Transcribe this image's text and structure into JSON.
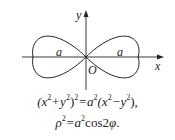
{
  "figure": {
    "type": "lemniscate of Bernoulli",
    "axis_labels": {
      "x": "x",
      "y": "y",
      "origin": "O"
    },
    "lobe_labels": [
      "a",
      "a"
    ],
    "colors": {
      "curve": "#222222",
      "axes": "#222222"
    }
  },
  "equations": {
    "cartesian": {
      "lhs_open": "(x",
      "exp1": "2",
      "plus": "+y",
      "exp2": "2",
      "close": ")",
      "exp3": "2",
      "eq": "=a",
      "exp4": "2",
      "paren": "(x",
      "exp5": "2",
      "minus": "−y",
      "exp6": "2",
      "end": "),"
    },
    "polar": {
      "rho": "ρ",
      "exp1": "2",
      "eq": "=a",
      "exp2": "2",
      "rest": "cos2",
      "phi": "φ",
      "end": "."
    }
  }
}
